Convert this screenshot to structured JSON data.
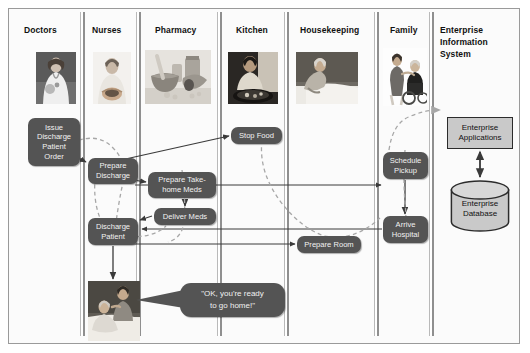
{
  "diagram": {
    "lanes": [
      {
        "id": "doctors",
        "label": "Doctors",
        "x": 10,
        "w": 70,
        "title_x": 24,
        "title_y": 24
      },
      {
        "id": "nurses",
        "label": "Nurses",
        "x": 85,
        "w": 50,
        "title_x": 92,
        "title_y": 24
      },
      {
        "id": "pharmacy",
        "label": "Pharmacy",
        "x": 140,
        "w": 77,
        "title_x": 155,
        "title_y": 24
      },
      {
        "id": "kitchen",
        "label": "Kitchen",
        "x": 222,
        "w": 62,
        "title_x": 236,
        "title_y": 24
      },
      {
        "id": "housekeeping",
        "label": "Housekeeping",
        "x": 289,
        "w": 85,
        "title_x": 300,
        "title_y": 24
      },
      {
        "id": "family",
        "label": "Family",
        "x": 379,
        "w": 50,
        "title_x": 390,
        "title_y": 24
      },
      {
        "id": "eis",
        "label": "Enterprise\nInformation\nSystem",
        "x": 434,
        "w": 78,
        "title_x": 440,
        "title_y": 24
      }
    ],
    "lane_rules_x": [
      80,
      136,
      217,
      284,
      374,
      429
    ],
    "photos": [
      {
        "id": "photo-doctor",
        "alt": "doctor-photo",
        "x": 36,
        "y": 52,
        "w": 40,
        "h": 52
      },
      {
        "id": "photo-nurse",
        "alt": "nurse-photo",
        "x": 93,
        "y": 52,
        "w": 38,
        "h": 52
      },
      {
        "id": "photo-pharmacy",
        "alt": "pharmacy-mortar-pestle-photo",
        "x": 145,
        "y": 50,
        "w": 66,
        "h": 54
      },
      {
        "id": "photo-kitchen",
        "alt": "kitchen-cook-photo",
        "x": 228,
        "y": 52,
        "w": 50,
        "h": 52
      },
      {
        "id": "photo-housekeeping",
        "alt": "housekeeper-making-bed-photo",
        "x": 296,
        "y": 52,
        "w": 62,
        "h": 52
      },
      {
        "id": "photo-family",
        "alt": "family-wheelchair-photo",
        "x": 383,
        "y": 48,
        "w": 44,
        "h": 58
      },
      {
        "id": "photo-patient-discharge",
        "alt": "patient-being-discharged-photo",
        "x": 88,
        "y": 281,
        "w": 52,
        "h": 60
      }
    ],
    "nodes": [
      {
        "id": "issue-discharge-patient-order",
        "label": "Issue\nDischarge\nPatient\nOrder",
        "x": 28,
        "y": 118,
        "w": 52,
        "h": 48
      },
      {
        "id": "prepare-discharge",
        "label": "Prepare\nDischarge",
        "x": 88,
        "y": 158,
        "w": 50,
        "h": 26
      },
      {
        "id": "prepare-take-home-meds",
        "label": "Prepare Take-\nhome Meds",
        "x": 148,
        "y": 172,
        "w": 68,
        "h": 26
      },
      {
        "id": "deliver-meds",
        "label": "Deliver Meds",
        "x": 154,
        "y": 208,
        "w": 62,
        "h": 17
      },
      {
        "id": "discharge-patient",
        "label": "Discharge\nPatient",
        "x": 88,
        "y": 218,
        "w": 50,
        "h": 27
      },
      {
        "id": "stop-food",
        "label": "Stop Food",
        "x": 231,
        "y": 127,
        "w": 51,
        "h": 17
      },
      {
        "id": "prepare-room",
        "label": "Prepare Room",
        "x": 297,
        "y": 236,
        "w": 64,
        "h": 17
      },
      {
        "id": "schedule-pickup",
        "label": "Schedule\nPickup",
        "x": 383,
        "y": 152,
        "w": 45,
        "h": 27
      },
      {
        "id": "arrive-hospital",
        "label": "Arrive\nHospital",
        "x": 383,
        "y": 216,
        "w": 45,
        "h": 27
      }
    ],
    "enterprise": {
      "applications": {
        "id": "enterprise-applications",
        "label": "Enterprise\nApplications",
        "x": 447,
        "y": 117,
        "w": 66,
        "h": 32
      },
      "database": {
        "id": "enterprise-database",
        "label": "Enterprise\nDatabase",
        "x": 450,
        "y": 180,
        "w": 60,
        "h": 52
      }
    },
    "speech_bubble": {
      "id": "speech-bubble",
      "text": "\"OK, you're ready\nto go home!\"",
      "x": 180,
      "y": 283,
      "w": 105,
      "h": 34
    },
    "colors": {
      "node_fill": "#545454",
      "node_text": "#f2f2f2",
      "enterprise_fill": "#c9c9c9",
      "enterprise_border": "#2b2b2b",
      "lane_rule": "#8f8f8f",
      "solid_arrow": "#3a3a3a",
      "dashed_arrow": "#9a9a9a",
      "frame_border": "#9a9a9a",
      "background": "#fbfbfb"
    }
  }
}
